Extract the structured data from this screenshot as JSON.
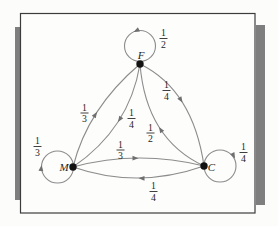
{
  "figure": {
    "type": "markov-chain-state-transition-diagram",
    "states": {
      "F": "F",
      "M": "M",
      "C": "C"
    },
    "self_loops": {
      "F": {
        "num": "1",
        "den": "2"
      },
      "M": {
        "num": "1",
        "den": "3"
      },
      "C": {
        "num": "1",
        "den": "4"
      }
    },
    "transitions": {
      "M_to_F": {
        "from": "M",
        "to": "F",
        "num": "1",
        "den": "3"
      },
      "F_to_M": {
        "from": "F",
        "to": "M",
        "num": "1",
        "den": "4"
      },
      "F_to_C": {
        "from": "F",
        "to": "C",
        "num": "1",
        "den": "4"
      },
      "C_to_F": {
        "from": "C",
        "to": "F",
        "num": "1",
        "den": "2"
      },
      "M_to_C": {
        "from": "M",
        "to": "C",
        "num": "1",
        "den": "3"
      },
      "C_to_M": {
        "from": "C",
        "to": "M",
        "num": "1",
        "den": "4"
      }
    },
    "colors": {
      "edge": "#8c8c8c",
      "arrowhead": "#6f6f6f",
      "node": "#121212",
      "text": "#1f1f1f",
      "frame_border": "#3c3c3c",
      "side_bar": "#7e7e7e",
      "background": "#fcfcfb"
    }
  }
}
